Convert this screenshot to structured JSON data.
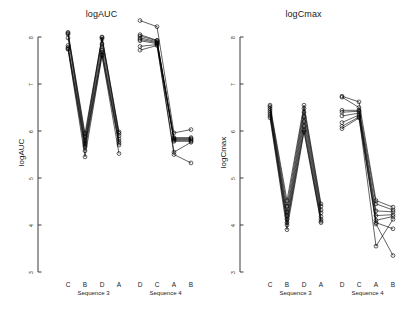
{
  "figure": {
    "background": "#ffffff",
    "foreground": "#000000",
    "width": 405,
    "height": 316
  },
  "panels": [
    {
      "id": "auc",
      "title": "logAUC",
      "ylabel": "logAUC"
    },
    {
      "id": "cmax",
      "title": "logCmax",
      "ylabel": "logCmax"
    }
  ],
  "axis": {
    "tick_labels": [
      "8",
      "7",
      "6",
      "5",
      "4",
      "3"
    ],
    "tick_values": [
      8,
      7,
      6,
      5,
      4,
      3
    ],
    "ylim": [
      3,
      8
    ]
  },
  "groups": [
    {
      "name": "Sequence 3",
      "label": "Sequence 3",
      "treatments": [
        "C",
        "B",
        "D",
        "A"
      ]
    },
    {
      "name": "Sequence 4",
      "label": "Sequence 4",
      "treatments": [
        "D",
        "C",
        "A",
        "B"
      ]
    }
  ],
  "chart_data": {
    "type": "line",
    "xlabel": "",
    "ylabel": "log-transformed PK parameter",
    "ylim": [
      3,
      8
    ],
    "grid": false,
    "legend": "none",
    "panels": [
      {
        "title": "logAUC",
        "ylabel": "logAUC",
        "ylim": [
          3,
          8
        ],
        "yticks": [
          3,
          4,
          5,
          6,
          7,
          8
        ],
        "groups": [
          {
            "name": "Sequence 3",
            "categories": [
              "C",
              "B",
              "D",
              "A"
            ],
            "series": [
              {
                "name": "subject-1",
                "values": [
                  8.1,
                  5.95,
                  8.0,
                  5.98
                ]
              },
              {
                "name": "subject-2",
                "values": [
                  8.08,
                  5.88,
                  7.99,
                  5.95
                ]
              },
              {
                "name": "subject-3",
                "values": [
                  8.06,
                  5.8,
                  7.96,
                  5.9
                ]
              },
              {
                "name": "subject-4",
                "values": [
                  7.98,
                  5.74,
                  7.85,
                  5.83
                ]
              },
              {
                "name": "subject-5",
                "values": [
                  7.82,
                  5.7,
                  7.72,
                  5.78
                ]
              },
              {
                "name": "subject-6",
                "values": [
                  7.78,
                  5.66,
                  7.68,
                  5.74
                ]
              },
              {
                "name": "subject-7",
                "values": [
                  7.75,
                  5.58,
                  7.62,
                  5.7
                ]
              },
              {
                "name": "subject-8",
                "values": [
                  7.74,
                  5.45,
                  7.6,
                  5.52
                ]
              }
            ]
          },
          {
            "name": "Sequence 4",
            "categories": [
              "D",
              "C",
              "A",
              "B"
            ],
            "series": [
              {
                "name": "subject-9",
                "values": [
                  8.35,
                  8.22,
                  5.96,
                  6.03
                ]
              },
              {
                "name": "subject-10",
                "values": [
                  8.05,
                  7.93,
                  5.86,
                  5.86
                ]
              },
              {
                "name": "subject-11",
                "values": [
                  8.02,
                  7.92,
                  5.84,
                  5.84
                ]
              },
              {
                "name": "subject-12",
                "values": [
                  7.98,
                  7.9,
                  5.82,
                  5.82
                ]
              },
              {
                "name": "subject-13",
                "values": [
                  7.95,
                  7.88,
                  5.8,
                  5.8
                ]
              },
              {
                "name": "subject-14",
                "values": [
                  7.92,
                  7.86,
                  5.78,
                  5.78
                ]
              },
              {
                "name": "subject-15",
                "values": [
                  7.8,
                  7.84,
                  5.55,
                  5.76
                ]
              },
              {
                "name": "subject-16",
                "values": [
                  7.72,
                  7.82,
                  5.5,
                  5.32
                ]
              }
            ]
          }
        ]
      },
      {
        "title": "logCmax",
        "ylabel": "logCmax",
        "ylim": [
          3,
          8
        ],
        "yticks": [
          3,
          4,
          5,
          6,
          7,
          8
        ],
        "groups": [
          {
            "name": "Sequence 3",
            "categories": [
              "C",
              "B",
              "D",
              "A"
            ],
            "series": [
              {
                "name": "subject-1",
                "values": [
                  6.55,
                  4.52,
                  6.55,
                  4.45
                ]
              },
              {
                "name": "subject-2",
                "values": [
                  6.52,
                  4.4,
                  6.48,
                  4.4
                ]
              },
              {
                "name": "subject-3",
                "values": [
                  6.48,
                  4.28,
                  6.4,
                  4.32
                ]
              },
              {
                "name": "subject-4",
                "values": [
                  6.44,
                  4.2,
                  6.3,
                  4.26
                ]
              },
              {
                "name": "subject-5",
                "values": [
                  6.4,
                  4.12,
                  6.2,
                  4.18
                ]
              },
              {
                "name": "subject-6",
                "values": [
                  6.36,
                  4.05,
                  6.1,
                  4.12
                ]
              },
              {
                "name": "subject-7",
                "values": [
                  6.32,
                  4.0,
                  6.02,
                  4.08
                ]
              },
              {
                "name": "subject-8",
                "values": [
                  6.28,
                  3.9,
                  5.98,
                  4.05
                ]
              }
            ]
          },
          {
            "name": "Sequence 4",
            "categories": [
              "D",
              "C",
              "A",
              "B"
            ],
            "series": [
              {
                "name": "subject-9",
                "values": [
                  6.74,
                  6.62,
                  4.52,
                  4.38
                ]
              },
              {
                "name": "subject-10",
                "values": [
                  6.72,
                  6.5,
                  4.45,
                  4.32
                ]
              },
              {
                "name": "subject-11",
                "values": [
                  6.44,
                  6.44,
                  4.3,
                  4.28
                ]
              },
              {
                "name": "subject-12",
                "values": [
                  6.4,
                  6.42,
                  4.2,
                  4.22
                ]
              },
              {
                "name": "subject-13",
                "values": [
                  6.32,
                  6.38,
                  4.1,
                  4.18
                ]
              },
              {
                "name": "subject-14",
                "values": [
                  6.18,
                  6.34,
                  4.05,
                  3.92
                ]
              },
              {
                "name": "subject-15",
                "values": [
                  6.1,
                  6.3,
                  3.55,
                  4.12
                ]
              },
              {
                "name": "subject-16",
                "values": [
                  6.05,
                  6.28,
                  4.02,
                  3.35
                ]
              }
            ]
          }
        ]
      }
    ]
  }
}
